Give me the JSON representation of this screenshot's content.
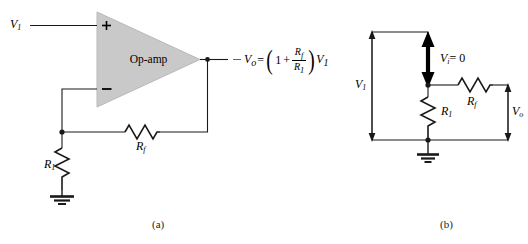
{
  "figure": {
    "type": "circuit-diagram",
    "subfigures": [
      {
        "caption": "(a)",
        "name": "op-amp-noninverting-amplifier"
      },
      {
        "caption": "(b)",
        "name": "equivalent-circuit"
      }
    ]
  },
  "circuit_a": {
    "input_label": "V",
    "input_sub": "1",
    "opamp_label": "Op-amp",
    "plus_terminal": "+",
    "minus_terminal": "−",
    "r1_label": "R",
    "r1_sub": "1",
    "rf_label": "R",
    "rf_sub": "f",
    "output_label": "V",
    "output_sub": "o",
    "equation": {
      "lhs": "V",
      "lhs_sub": "o",
      "equals": "=",
      "one": "1",
      "plus": "+",
      "numerator": "R",
      "numerator_sub": "f",
      "denominator": "R",
      "denominator_sub": "1",
      "multiplier": "V",
      "multiplier_sub": "1",
      "plain_text": "Vo = (1 + Rf/R1) V1"
    }
  },
  "circuit_b": {
    "v1_label": "V",
    "v1_sub": "1",
    "vi_label": "V",
    "vi_sub": "i",
    "vi_value": "= 0",
    "vi_plain": "Vi = 0",
    "r1_label": "R",
    "r1_sub": "1",
    "rf_label": "R",
    "rf_sub": "f",
    "vo_label": "V",
    "vo_sub": "o"
  },
  "colors": {
    "wire": "#1a1a1a",
    "opamp_fill": "#c9c9c9",
    "opamp_stroke": "#b0b0b0",
    "background": "#ffffff",
    "text": "#000000"
  }
}
